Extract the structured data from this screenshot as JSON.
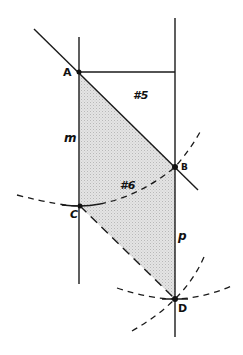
{
  "diagram": {
    "type": "geometric-construction",
    "colors": {
      "stroke": "#1a1a1a",
      "shade": "#d9d9d9",
      "background": "#ffffff"
    },
    "points": [
      {
        "id": "A",
        "label": "A",
        "x": 79,
        "y": 72
      },
      {
        "id": "B",
        "label": "B",
        "x": 175,
        "y": 167
      },
      {
        "id": "C",
        "label": "C",
        "x": 80,
        "y": 206
      },
      {
        "id": "D",
        "label": "D",
        "x": 175,
        "y": 299
      }
    ],
    "lines": [
      {
        "id": "m",
        "label": "m",
        "kind": "solid",
        "from": [
          79,
          37
        ],
        "to": [
          79,
          284
        ]
      },
      {
        "id": "p",
        "label": "p",
        "kind": "solid",
        "from": [
          175,
          18
        ],
        "to": [
          175,
          337
        ]
      },
      {
        "id": "AB-ext",
        "kind": "solid",
        "from": [
          34,
          29
        ],
        "to": [
          198,
          190
        ]
      },
      {
        "id": "A-horizontal",
        "kind": "solid",
        "from": [
          79,
          72
        ],
        "to": [
          175,
          72
        ]
      },
      {
        "id": "CD",
        "kind": "dashed",
        "from": [
          80,
          206
        ],
        "to": [
          175,
          299
        ]
      }
    ],
    "arcs": [
      {
        "id": "arc-C-B",
        "kind": "dashed",
        "through": "C,B"
      },
      {
        "id": "arc-D-horizontal",
        "kind": "dashed",
        "through": "D"
      },
      {
        "id": "arc-D-diagonal",
        "kind": "dashed",
        "through": "D"
      }
    ],
    "region_labels": [
      {
        "id": "r5",
        "label": "#5",
        "x": 132,
        "y": 93
      },
      {
        "id": "r6",
        "label": "#6",
        "x": 120,
        "y": 180
      }
    ],
    "line_labels": [
      {
        "id": "m",
        "label": "m",
        "x": 64,
        "y": 134
      },
      {
        "id": "p",
        "label": "p",
        "x": 178,
        "y": 231
      }
    ]
  }
}
